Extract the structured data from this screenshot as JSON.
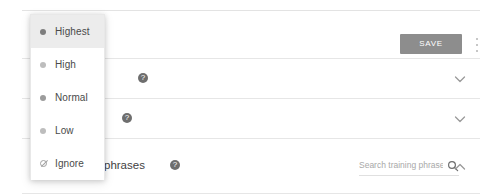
{
  "header": {
    "name_field_value": "",
    "save_label": "SAVE",
    "overflow_menu_name": "more-options"
  },
  "sections": [
    {
      "label": "",
      "help_icon": "?",
      "chevron": "chevron-down",
      "expanded": false
    },
    {
      "label": "",
      "help_icon": "?",
      "chevron": "chevron-down",
      "expanded": false
    },
    {
      "label": "phrases",
      "help_icon": "?",
      "chevron": "chevron-up",
      "expanded": true,
      "search_placeholder": "Search training phrases",
      "search_value": "",
      "search_icon": "search-icon"
    }
  ],
  "dropdown": {
    "open": true,
    "items": [
      {
        "label": "Highest",
        "icon": "bullet",
        "selected": true
      },
      {
        "label": "High",
        "icon": "bullet",
        "selected": false
      },
      {
        "label": "Normal",
        "icon": "bullet",
        "selected": false
      },
      {
        "label": "Low",
        "icon": "bullet",
        "selected": false
      },
      {
        "label": "Ignore",
        "icon": "ban-icon",
        "selected": false
      }
    ]
  },
  "colors": {
    "save_button_bg": "#8d8d8d",
    "save_button_text": "#ffffff",
    "selected_row_bg": "#ececec",
    "divider": "#e6e6e6",
    "help_icon_bg": "#6e6e6e",
    "text": "#4a4a4a"
  }
}
